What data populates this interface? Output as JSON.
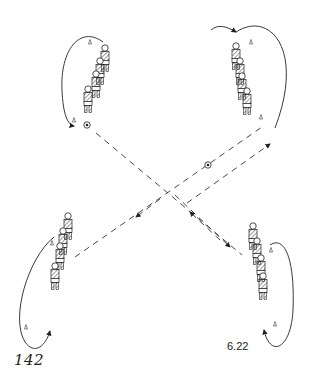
{
  "diagram": {
    "type": "soccer-drill",
    "groups": [
      {
        "position": "top-left",
        "players": 4,
        "cones": 2,
        "has_ball": true
      },
      {
        "position": "top-right",
        "players": 4,
        "cones": 2,
        "has_ball": false
      },
      {
        "position": "bottom-left",
        "players": 4,
        "cones": 2,
        "has_ball": false
      },
      {
        "position": "bottom-right",
        "players": 4,
        "cones": 2,
        "has_ball": false
      }
    ],
    "center_ball": true,
    "colors": {
      "line": "#222222",
      "background": "#ffffff"
    }
  },
  "page": {
    "number": "142",
    "figure_label": "6.22"
  }
}
